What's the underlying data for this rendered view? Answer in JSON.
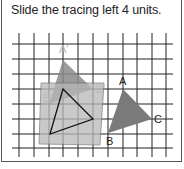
{
  "instruction": "Slide the tracing left 4 units.",
  "grid": {
    "x_lines": [
      19,
      34,
      49,
      63,
      78,
      93,
      108,
      123,
      137,
      152,
      166
    ],
    "y_lines": [
      44,
      59,
      74,
      89,
      104,
      119,
      134,
      148
    ],
    "x_range": [
      12,
      173
    ],
    "y_range": [
      33,
      157
    ],
    "line_color": "#222222"
  },
  "original_triangle": {
    "fill": "#7a7a7a",
    "A": {
      "label": "A",
      "x": 123,
      "y": 89
    },
    "B": {
      "label": "B",
      "x": 108,
      "y": 133
    },
    "C": {
      "label": "C",
      "x": 152,
      "y": 119
    }
  },
  "image_triangle": {
    "fill": "#8a8a8a",
    "A": {
      "label": "A'",
      "x": 63,
      "y": 60
    },
    "B": {
      "label": "B'",
      "x": 49,
      "y": 104
    },
    "C": {
      "label": "C'",
      "x": 93,
      "y": 89
    }
  },
  "tracing_paper": {
    "fill": "#b8b8b8",
    "traced_triangle": {
      "A": {
        "x": 63,
        "y": 89
      },
      "B": {
        "x": 50,
        "y": 134
      },
      "C": {
        "x": 93,
        "y": 119
      }
    }
  },
  "translation": {
    "direction": "left",
    "units": 4
  }
}
